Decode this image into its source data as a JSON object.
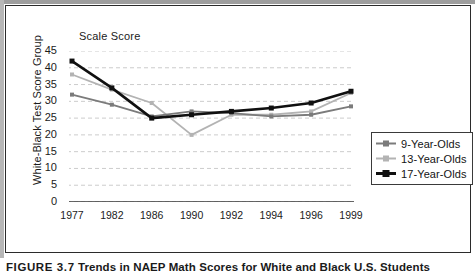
{
  "figure": {
    "caption_number": "FIGURE 3.7",
    "caption_text": "Trends in NAEP Math Scores for White and Black U.S. Students"
  },
  "chart_data": {
    "type": "line",
    "title": "",
    "subtitle": "",
    "axis_note": "Scale Score",
    "xlabel": "",
    "ylabel": "White-Black Test Score Group",
    "categories": [
      "1977",
      "1982",
      "1986",
      "1990",
      "1992",
      "1994",
      "1996",
      "1999"
    ],
    "ylim": [
      0,
      45
    ],
    "ytick_labels": [
      "0",
      "5",
      "10",
      "15",
      "20",
      "25",
      "30",
      "35",
      "40",
      "45"
    ],
    "ytick_values": [
      0,
      5,
      10,
      15,
      20,
      25,
      30,
      35,
      40,
      45
    ],
    "grid": "horizontal-dashed",
    "legend_position": "lower-right",
    "series": [
      {
        "name": "9-Year-Olds",
        "color": "#7b7b7b",
        "values": [
          32,
          29,
          25.5,
          27,
          26.5,
          25.5,
          26,
          28.5
        ]
      },
      {
        "name": "13-Year-Olds",
        "color": "#b3b3b3",
        "values": [
          38,
          33.5,
          29.5,
          20,
          26,
          26,
          27,
          32.5
        ]
      },
      {
        "name": "17-Year-Olds",
        "color": "#101010",
        "values": [
          42,
          34,
          25,
          26,
          27,
          28,
          29.5,
          33
        ]
      }
    ]
  },
  "colors": {
    "frame": "#2b2b2b",
    "gridline": "#cccccc",
    "axis": "#333333",
    "text": "#1b1b1b"
  }
}
